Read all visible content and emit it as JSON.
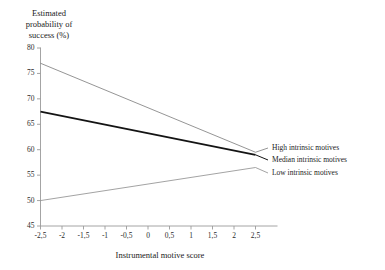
{
  "chart_data": {
    "type": "line",
    "title": "Estimated probability of success (%)",
    "title_lines": "Estimated\nprobability of\nsuccess (%)",
    "xlabel": "Instrumental motive score",
    "ylabel": "Estimated probability of success (%)",
    "xlim": [
      -2.5,
      2.5
    ],
    "ylim": [
      45,
      80
    ],
    "grid": false,
    "legend_position": "right-of-plot",
    "decimal_separator": ",",
    "xticks": [
      "-2,5",
      "-2",
      "-1,5",
      "-1",
      "-0,5",
      "0",
      "0,5",
      "1",
      "1,5",
      "2",
      "2,5"
    ],
    "xtick_values": [
      -2.5,
      -2,
      -1.5,
      -1,
      -0.5,
      0,
      0.5,
      1,
      1.5,
      2,
      2.5
    ],
    "yticks": [
      "45",
      "50",
      "55",
      "60",
      "65",
      "70",
      "75",
      "80"
    ],
    "ytick_values": [
      45,
      50,
      55,
      60,
      65,
      70,
      75,
      80
    ],
    "x": [
      -2.5,
      2.5
    ],
    "series": [
      {
        "name": "High intrinsic motives",
        "values": [
          77.0,
          59.5
        ],
        "color": "#7a7a7a",
        "width": 0.8
      },
      {
        "name": "Median intrinsic motives",
        "values": [
          67.5,
          59.0
        ],
        "color": "#141414",
        "width": 1.8
      },
      {
        "name": "Low intrinsic motives",
        "values": [
          50.0,
          56.5
        ],
        "color": "#8c8c8c",
        "width": 0.8
      }
    ]
  },
  "legend": {
    "items": [
      {
        "label": "High intrinsic motives"
      },
      {
        "label": "Median intrinsic motives"
      },
      {
        "label": "Low intrinsic motives"
      }
    ]
  },
  "colors": {
    "axis": "#9a9a9a",
    "text": "#1a1a1a",
    "high": "#7a7a7a",
    "median": "#141414",
    "low": "#8c8c8c"
  }
}
